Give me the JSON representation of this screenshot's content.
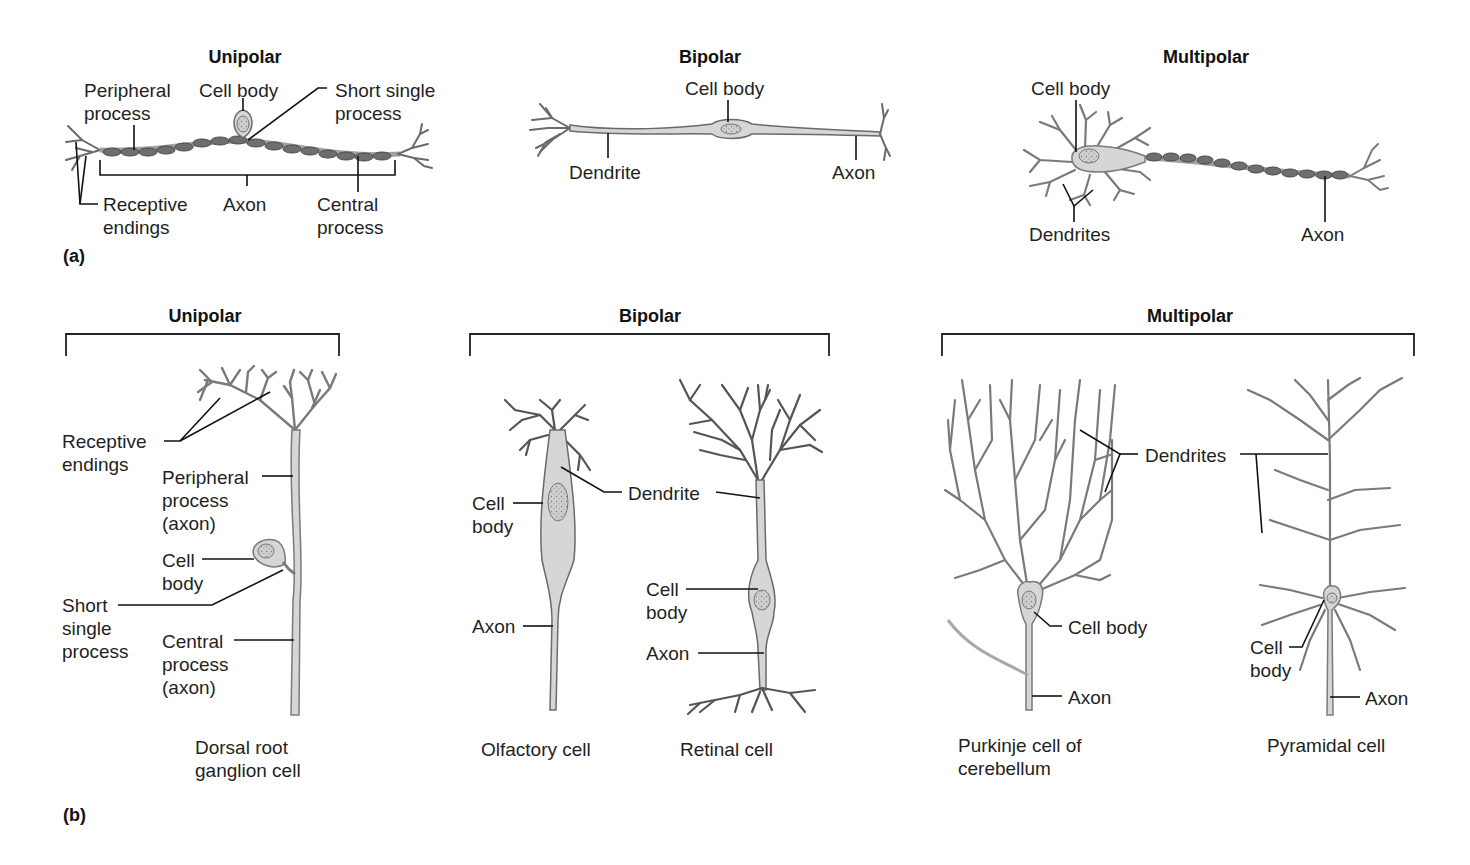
{
  "figure": {
    "panel_a_label": "(a)",
    "panel_b_label": "(b)",
    "colors": {
      "cell_fill": "#d6d6d6",
      "cell_stroke": "#6a6a6a",
      "myelin_fill": "#6e6e6e",
      "leader_line": "#111111",
      "nucleus_fill": "#c4c4c4"
    }
  },
  "panel_a": {
    "unipolar": {
      "title": "Unipolar",
      "labels": {
        "peripheral_process": [
          "Peripheral",
          "process"
        ],
        "cell_body": "Cell body",
        "short_single_process": [
          "Short single",
          "process"
        ],
        "receptive_endings": [
          "Receptive",
          "endings"
        ],
        "axon": "Axon",
        "central_process": [
          "Central",
          "process"
        ]
      }
    },
    "bipolar": {
      "title": "Bipolar",
      "labels": {
        "cell_body": "Cell body",
        "dendrite": "Dendrite",
        "axon": "Axon"
      }
    },
    "multipolar": {
      "title": "Multipolar",
      "labels": {
        "cell_body": "Cell body",
        "dendrites": "Dendrites",
        "axon": "Axon"
      }
    }
  },
  "panel_b": {
    "unipolar": {
      "title": "Unipolar",
      "cells": [
        {
          "name": [
            "Dorsal root",
            "ganglion cell"
          ],
          "labels": {
            "receptive_endings": [
              "Receptive",
              "endings"
            ],
            "peripheral_process": [
              "Peripheral",
              "process",
              "(axon)"
            ],
            "cell_body": [
              "Cell",
              "body"
            ],
            "short_single_process": [
              "Short",
              "single",
              "process"
            ],
            "central_process": [
              "Central",
              "process",
              "(axon)"
            ]
          }
        }
      ]
    },
    "bipolar": {
      "title": "Bipolar",
      "cells": [
        {
          "name": "Olfactory cell",
          "labels": {
            "cell_body": [
              "Cell",
              "body"
            ],
            "axon": "Axon"
          }
        },
        {
          "name": "Retinal cell",
          "labels": {
            "cell_body": [
              "Cell",
              "body"
            ],
            "axon": "Axon"
          }
        }
      ],
      "shared_labels": {
        "dendrite": "Dendrite"
      }
    },
    "multipolar": {
      "title": "Multipolar",
      "cells": [
        {
          "name": [
            "Purkinje cell of",
            "cerebellum"
          ],
          "labels": {
            "cell_body": "Cell body",
            "axon": "Axon"
          }
        },
        {
          "name": "Pyramidal cell",
          "labels": {
            "cell_body": [
              "Cell",
              "body"
            ],
            "axon": "Axon"
          }
        }
      ],
      "shared_labels": {
        "dendrites": "Dendrites"
      }
    }
  }
}
